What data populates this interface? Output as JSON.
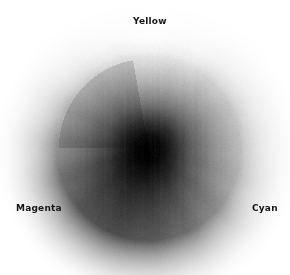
{
  "figure": {
    "background_color": "#ffffff",
    "width": 290,
    "height": 275
  },
  "labels": {
    "yellow": "Yellow",
    "magenta": "Magenta",
    "cyan": "Cyan",
    "color": "#161616"
  },
  "chart_data": {
    "type": "pie",
    "title": "",
    "subtitle": "",
    "xlabel": "",
    "ylabel": "",
    "grid": false,
    "legend_position": "none",
    "center": {
      "x": 148,
      "y": 148
    },
    "outer_radius": 112,
    "core_radius": 26,
    "spoke_count": 16,
    "annotations": [
      {
        "text": "Yellow",
        "angle_deg": 90,
        "x": 153,
        "y": 21
      },
      {
        "text": "Magenta",
        "angle_deg": 210,
        "x": 39,
        "y": 208
      },
      {
        "text": "Cyan",
        "angle_deg": 330,
        "x": 268,
        "y": 208
      }
    ],
    "categories": [
      "Yellow",
      "Yellow-Green",
      "Green",
      "Green-Cyan",
      "Cyan",
      "Cyan-Blue",
      "Blue",
      "Blue-Magenta",
      "Magenta",
      "Magenta-Red",
      "Red",
      "Red-Orange",
      "Orange",
      "Orange-Yellow",
      "Warm-Yellow",
      "Pale-Yellow"
    ],
    "series": [
      {
        "name": "Spoke luminance (0-255)",
        "values": [
          250,
          242,
          226,
          214,
          205,
          186,
          150,
          118,
          96,
          84,
          92,
          118,
          158,
          196,
          224,
          240
        ]
      }
    ],
    "angles_deg": [
      90,
      67.5,
      45,
      22.5,
      0,
      337.5,
      315,
      292.5,
      270,
      247.5,
      225,
      202.5,
      180,
      157.5,
      135,
      112.5
    ],
    "radial_profile": {
      "note": "Luminance along radius from center outward, fraction of spoke peak",
      "stops": [
        0.0,
        0.12,
        0.24,
        0.4,
        0.58,
        0.75,
        0.88,
        1.0
      ],
      "values": [
        0.02,
        0.06,
        0.22,
        0.48,
        0.7,
        0.86,
        0.96,
        1.0
      ]
    },
    "ylim": [
      0,
      255
    ],
    "colors": {
      "core": "#0a0a0a",
      "mid": "#6e6e6e",
      "rim": "#f2f2f2",
      "background": "#ffffff"
    }
  }
}
